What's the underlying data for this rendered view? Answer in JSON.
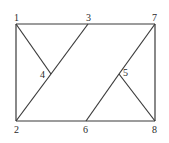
{
  "diagram": {
    "type": "graph",
    "nodes": [
      {
        "id": "1",
        "label": "1",
        "x": 16,
        "y": 24
      },
      {
        "id": "2",
        "label": "2",
        "x": 16,
        "y": 121
      },
      {
        "id": "3",
        "label": "3",
        "x": 88,
        "y": 24
      },
      {
        "id": "4",
        "label": "4",
        "x": 51,
        "y": 74
      },
      {
        "id": "5",
        "label": "5",
        "x": 119,
        "y": 74
      },
      {
        "id": "6",
        "label": "6",
        "x": 86,
        "y": 121
      },
      {
        "id": "7",
        "label": "7",
        "x": 155,
        "y": 24
      },
      {
        "id": "8",
        "label": "8",
        "x": 155,
        "y": 121
      }
    ],
    "edges": [
      [
        "1",
        "3"
      ],
      [
        "3",
        "7"
      ],
      [
        "1",
        "2"
      ],
      [
        "2",
        "6"
      ],
      [
        "6",
        "8"
      ],
      [
        "7",
        "8"
      ],
      [
        "1",
        "4"
      ],
      [
        "3",
        "4"
      ],
      [
        "4",
        "2"
      ],
      [
        "7",
        "5"
      ],
      [
        "5",
        "6"
      ],
      [
        "5",
        "8"
      ]
    ]
  }
}
